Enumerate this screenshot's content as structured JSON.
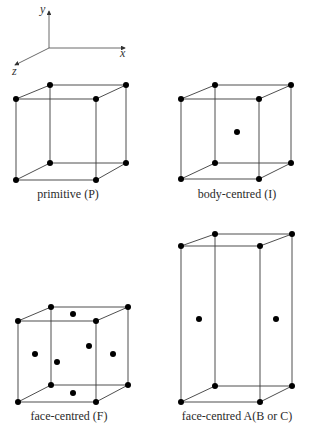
{
  "axes": {
    "x_label": "x",
    "y_label": "y",
    "z_label": "z"
  },
  "lattices": [
    {
      "id": "primitive",
      "label": "primitive (P)"
    },
    {
      "id": "body-centred",
      "label": "body-centred (I)"
    },
    {
      "id": "face-centred",
      "label": "face-centred (F)"
    },
    {
      "id": "face-centred-a",
      "label": "face-centred A(B or C)"
    }
  ],
  "colors": {
    "line": "#3a3a3a",
    "atom": "#000000",
    "background": "#ffffff"
  }
}
